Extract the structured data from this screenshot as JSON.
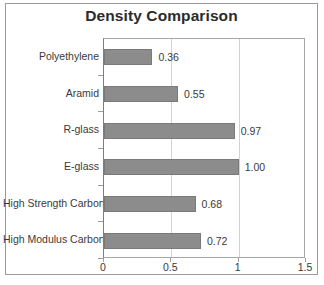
{
  "chart_data": {
    "type": "bar",
    "orientation": "horizontal",
    "title": "Density Comparison",
    "xlabel": "",
    "ylabel": "",
    "categories": [
      "Polyethylene",
      "Aramid",
      "R-glass",
      "E-glass",
      "High Strength Carbon",
      "High Modulus Carbon"
    ],
    "values": [
      0.36,
      0.55,
      0.97,
      1.0,
      0.68,
      0.72
    ],
    "value_labels": [
      "0.36",
      "0.55",
      "0.97",
      "1.00",
      "0.68",
      "0.72"
    ],
    "xlim": [
      0,
      1.5
    ],
    "xticks": [
      0,
      0.5,
      1,
      1.5
    ],
    "xtick_labels": [
      "0",
      "0.5",
      "1",
      "1.5"
    ],
    "grid": "vertical",
    "legend": "none",
    "bar_color": "#8c8c8c",
    "gridline_color": "#d2d2d2",
    "title_color": "#2b2b2b",
    "text_color": "#3a3a3a"
  }
}
